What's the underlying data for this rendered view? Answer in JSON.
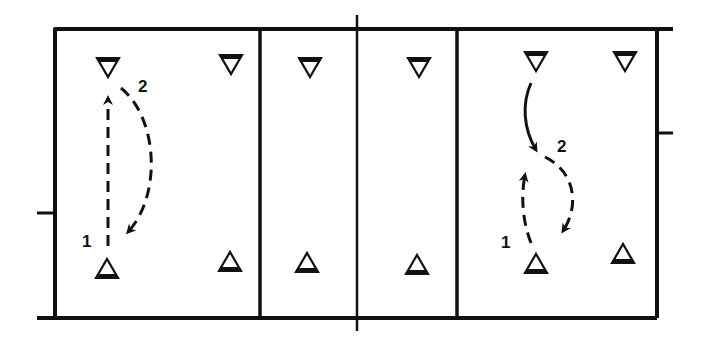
{
  "diagram": {
    "type": "court-drill-diagram",
    "colors": {
      "ink": "#111111",
      "background": "#ffffff"
    },
    "court": {
      "outer": {
        "left": 55,
        "top": 29,
        "right": 657,
        "bottom": 318
      },
      "top_line_extends_to": 673,
      "bottom_line_starts_at": 37,
      "net_x": 357,
      "inner_lines_x": [
        260,
        457
      ],
      "side_ticks": [
        {
          "side": "left",
          "y": 213,
          "x1": 37,
          "x2": 55
        },
        {
          "side": "right",
          "y": 133,
          "x1": 657,
          "x2": 673
        }
      ]
    },
    "players_facing_down": [
      {
        "id": "left-back-1",
        "x": 108,
        "y": 67
      },
      {
        "id": "left-back-2",
        "x": 231,
        "y": 64
      },
      {
        "id": "left-front-top",
        "x": 310,
        "y": 67
      },
      {
        "id": "right-front-top",
        "x": 419,
        "y": 67
      },
      {
        "id": "right-back-1",
        "x": 536,
        "y": 61
      },
      {
        "id": "right-back-2",
        "x": 625,
        "y": 61
      }
    ],
    "players_facing_up": [
      {
        "id": "left-back-3",
        "x": 107,
        "y": 269
      },
      {
        "id": "left-back-4",
        "x": 230,
        "y": 262
      },
      {
        "id": "left-front-bottom",
        "x": 307,
        "y": 263
      },
      {
        "id": "right-front-bottom",
        "x": 417,
        "y": 265
      },
      {
        "id": "right-back-3",
        "x": 536,
        "y": 264
      },
      {
        "id": "right-back-4",
        "x": 623,
        "y": 254
      }
    ],
    "labels": [
      {
        "id": "left-label-2",
        "text": "2",
        "x": 138,
        "y": 92
      },
      {
        "id": "left-label-1",
        "text": "1",
        "x": 82,
        "y": 247
      },
      {
        "id": "right-label-2",
        "text": "2",
        "x": 557,
        "y": 152
      },
      {
        "id": "right-label-1",
        "text": "1",
        "x": 501,
        "y": 248
      }
    ],
    "paths": [
      {
        "id": "left-move-1",
        "label": "1",
        "style": "dashed",
        "d": "M 108 246 L 108 98",
        "arrow_at": "end"
      },
      {
        "id": "left-move-2",
        "label": "2",
        "style": "dashed",
        "d": "M 121 88 C 158 118, 162 195, 128 232",
        "arrow_at": "end"
      },
      {
        "id": "right-move-top",
        "label": "",
        "style": "solid",
        "d": "M 531 83 C 522 103, 523 128, 536 150",
        "arrow_at": "end"
      },
      {
        "id": "right-move-1",
        "label": "1",
        "style": "dashed",
        "d": "M 531 243 C 522 220, 521 195, 525 175",
        "arrow_at": "end"
      },
      {
        "id": "right-move-2",
        "label": "2",
        "style": "dashed",
        "d": "M 545 157 C 575 172, 580 205, 563 231",
        "arrow_at": "end"
      }
    ]
  }
}
